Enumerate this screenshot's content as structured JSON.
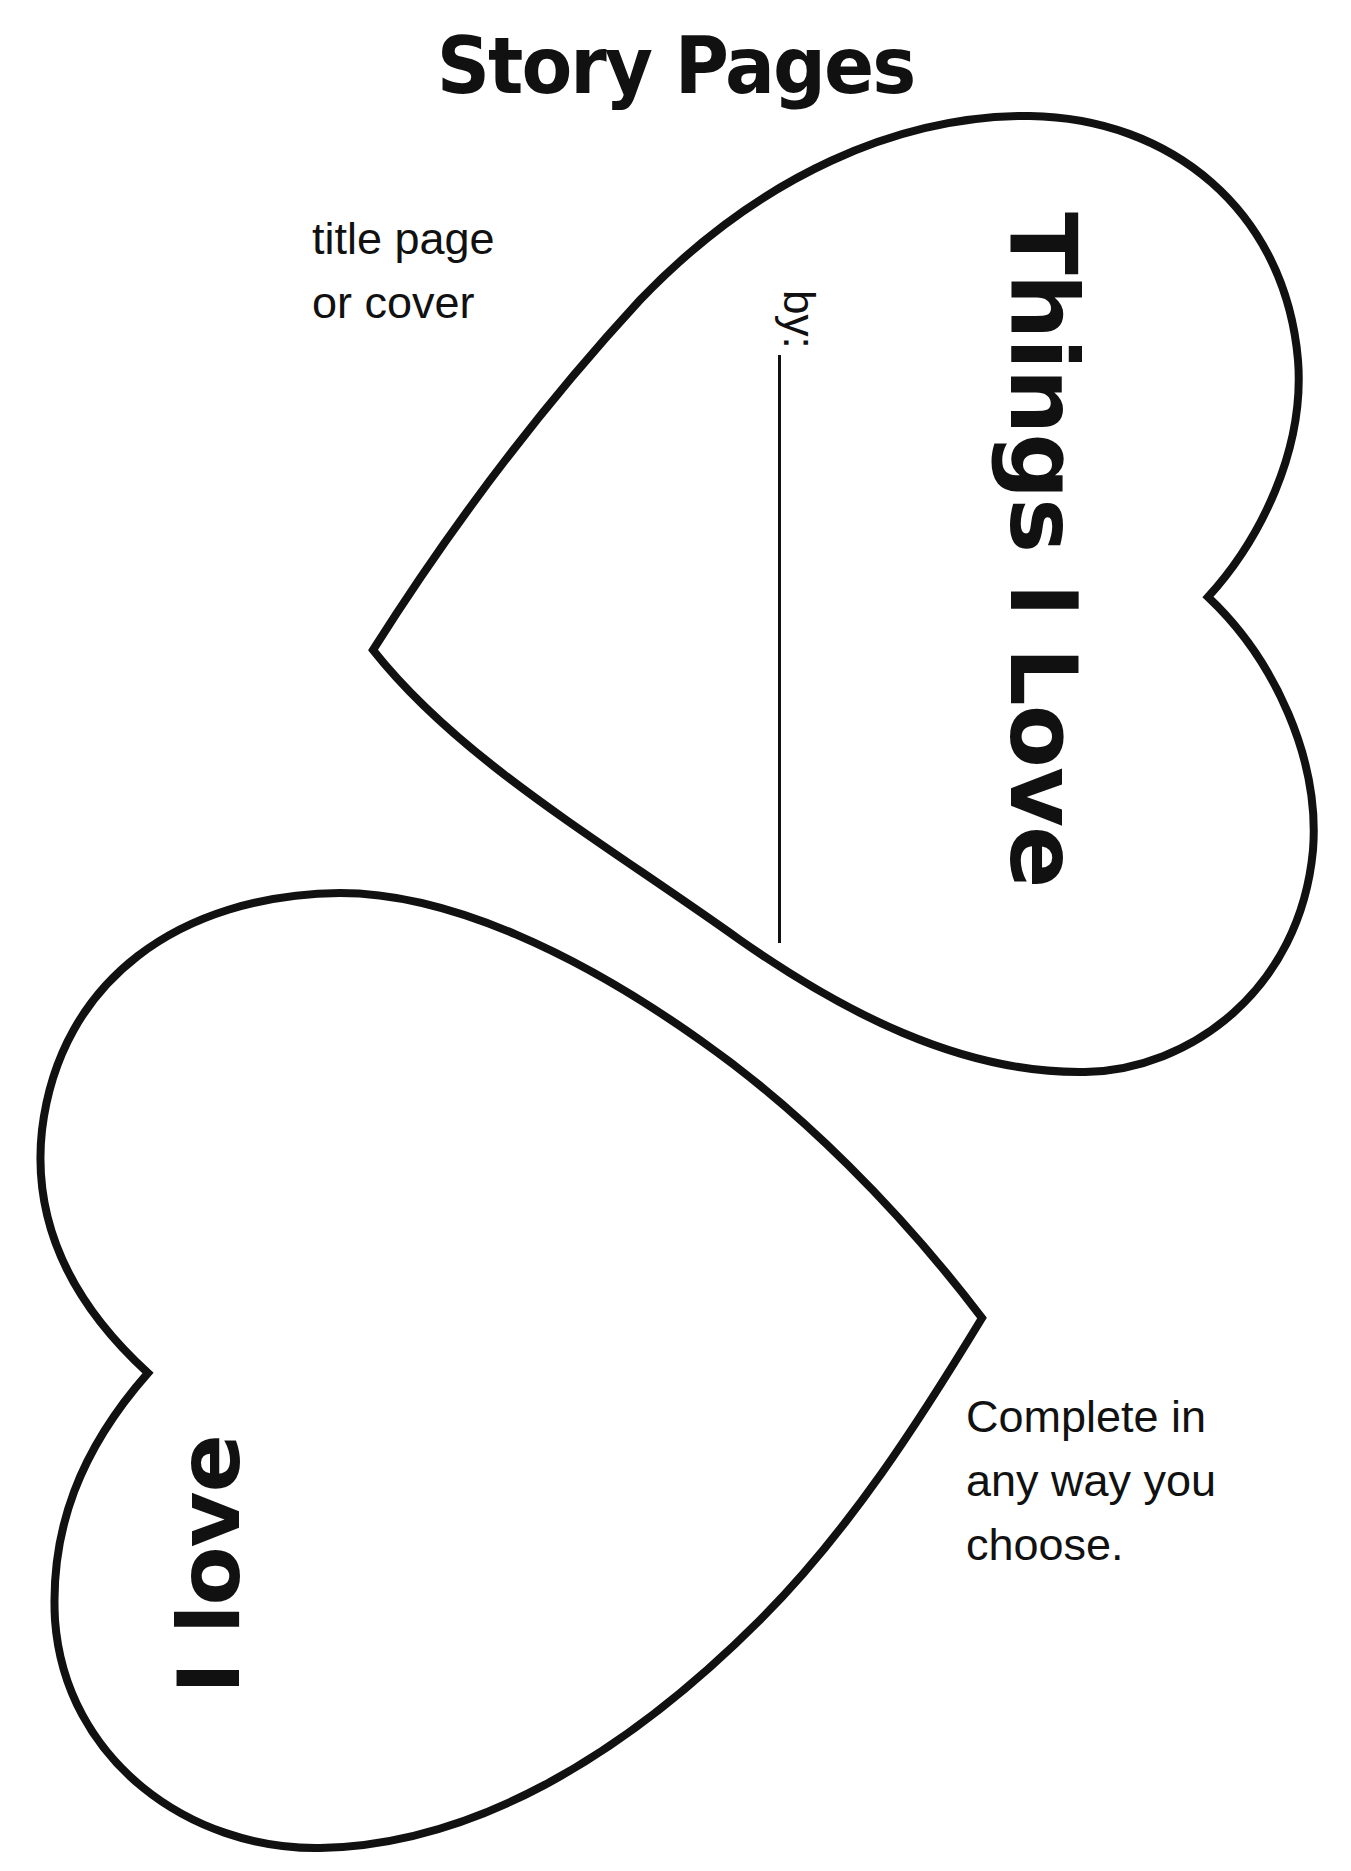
{
  "header": {
    "title": "Story Pages"
  },
  "cover_heart": {
    "label_note": [
      "title page",
      "or cover"
    ],
    "title": "Things I Love",
    "byline_label": "by:",
    "byline_value": ""
  },
  "page_heart": {
    "text": "I love",
    "label_note": [
      "Complete in",
      "any way you",
      "choose."
    ]
  },
  "colors": {
    "ink": "#111111",
    "paper": "#ffffff"
  }
}
